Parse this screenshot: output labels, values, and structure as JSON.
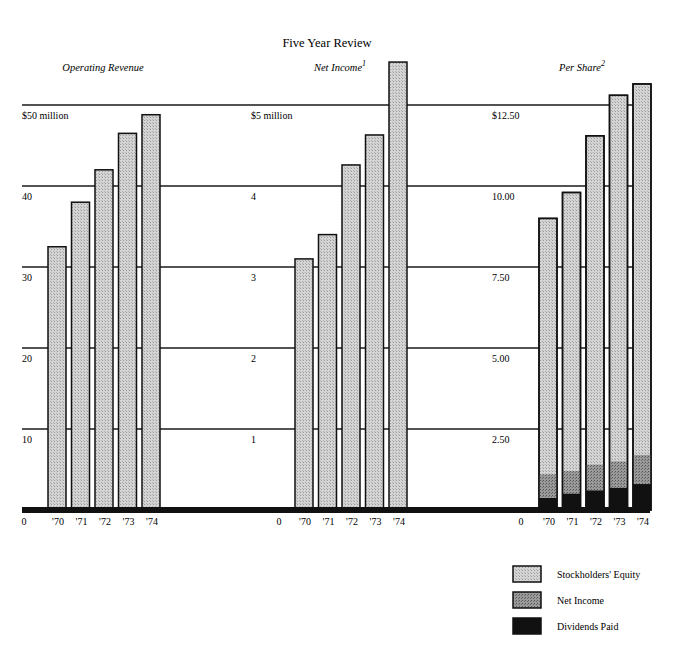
{
  "chart_data": {
    "title": "Five Year Review",
    "type": "bar",
    "panels": [
      {
        "id": "operating-revenue",
        "subtitle": "Operating Revenue",
        "footnote": "",
        "type": "bar",
        "categories": [
          "'70",
          "'71",
          "'72",
          "'73",
          "'74"
        ],
        "values": [
          32.5,
          38.0,
          42.0,
          46.5,
          48.8
        ],
        "unit": "$ million",
        "ylim": [
          0,
          50
        ],
        "yticks": [
          0,
          10,
          20,
          30,
          40,
          50
        ],
        "ytick_labels": [
          "0",
          "10",
          "20",
          "30",
          "40",
          "$50 million"
        ],
        "grid": true
      },
      {
        "id": "net-income",
        "subtitle": "Net Income",
        "footnote": "1",
        "type": "bar",
        "categories": [
          "'70",
          "'71",
          "'72",
          "'73",
          "'74"
        ],
        "values": [
          3.1,
          3.4,
          4.26,
          4.63,
          5.53
        ],
        "unit": "$ million",
        "ylim": [
          0,
          5
        ],
        "yticks": [
          0,
          1,
          2,
          3,
          4,
          5
        ],
        "ytick_labels": [
          "0",
          "1",
          "2",
          "3",
          "4",
          "$5 million"
        ],
        "grid": true
      },
      {
        "id": "per-share",
        "subtitle": "Per Share",
        "footnote": "2",
        "type": "stacked-bar",
        "categories": [
          "'70",
          "'71",
          "'72",
          "'73",
          "'74"
        ],
        "series": [
          {
            "name": "Dividends Paid",
            "values": [
              0.37,
              0.5,
              0.6,
              0.68,
              0.8
            ]
          },
          {
            "name": "Net Income",
            "values": [
              1.1,
              1.2,
              1.4,
              1.5,
              1.7
            ]
          },
          {
            "name": "Stockholders' Equity",
            "values": [
              9.0,
              9.8,
              11.55,
              12.8,
              13.15
            ]
          }
        ],
        "note": "Stacked segments overlap from baseline; each series value is the segment top in dollars per share",
        "ylim": [
          0,
          12.5
        ],
        "yticks": [
          0,
          2.5,
          5.0,
          7.5,
          10.0,
          12.5
        ],
        "ytick_labels": [
          "0",
          "2.50",
          "5.00",
          "7.50",
          "10.00",
          "$12.50"
        ],
        "grid": true
      }
    ],
    "legend": {
      "placement": "bottom-right",
      "entries": [
        {
          "label": "Stockholders' Equity",
          "pattern": "light-stipple"
        },
        {
          "label": "Net Income",
          "pattern": "medium-stipple"
        },
        {
          "label": "Dividends Paid",
          "pattern": "solid-black"
        }
      ]
    },
    "colors": {
      "equity_fill": "#c8c8c8",
      "net_income_fill": "#8a8a8a",
      "dividends_fill": "#111111",
      "outline": "#111111",
      "gridline": "#1a1a1a"
    }
  }
}
